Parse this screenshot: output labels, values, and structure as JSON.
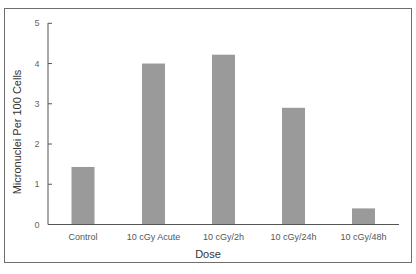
{
  "chart_data": {
    "type": "bar",
    "title": "",
    "xlabel": "Dose",
    "ylabel": "Micronuclei Per 100 Cells",
    "categories": [
      "Control",
      "10 cGy Acute",
      "10 cGy/2h",
      "10 cGy/24h",
      "10 cGy/48h"
    ],
    "values": [
      1.43,
      4.0,
      4.22,
      2.9,
      0.4
    ],
    "ylim": [
      0,
      5
    ],
    "yticks": [
      "0",
      "1",
      "2",
      "3",
      "4",
      "5"
    ],
    "grid": false,
    "legend": null,
    "bar_color": "#9a9a9a"
  }
}
